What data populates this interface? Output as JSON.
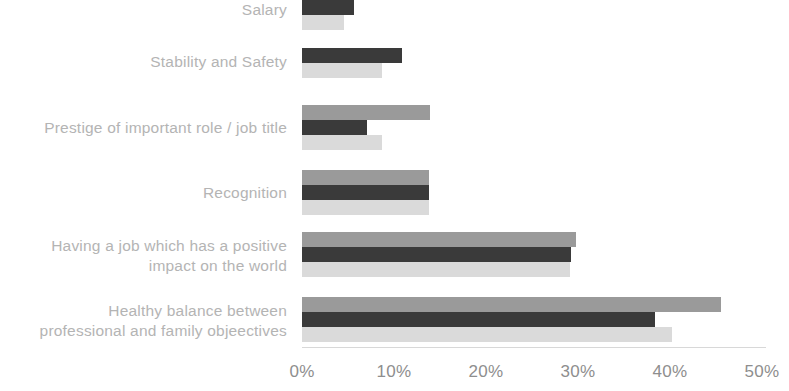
{
  "chart_data": {
    "type": "bar",
    "orientation": "horizontal",
    "title": "",
    "subtitle": "",
    "xlabel": "",
    "ylabel": "",
    "xlim": [
      0,
      50
    ],
    "xunit": "%",
    "grid": false,
    "legend": "none",
    "xticks": [
      {
        "label": "0%",
        "value": 0
      },
      {
        "label": "10%",
        "value": 10
      },
      {
        "label": "20%",
        "value": 20
      },
      {
        "label": "30%",
        "value": 30
      },
      {
        "label": "40%",
        "value": 40
      },
      {
        "label": "50%",
        "value": 50
      }
    ],
    "categories": [
      "Salary",
      "Stability and Safety",
      "Prestige of important role / job title",
      "Recognition",
      "Having a job which has a positive\nimpact on the world",
      "Healthy balance between\nprofessional and family objeectives"
    ],
    "series": [
      {
        "name": "series-a",
        "color": "#9a9a9a",
        "values": [
          null,
          null,
          13.9,
          13.8,
          29.8,
          45.5
        ]
      },
      {
        "name": "series-b",
        "color": "#3a3a3a",
        "values": [
          5.7,
          10.9,
          7.1,
          13.8,
          29.2,
          38.4
        ]
      },
      {
        "name": "series-c",
        "color": "#dadada",
        "values": [
          4.6,
          8.7,
          8.7,
          13.8,
          29.1,
          40.2
        ]
      }
    ]
  },
  "axis": {
    "tick_color": "#8e8e8e",
    "line_color": "#d8d8d8"
  },
  "labels": {
    "color": "#b4b4b4"
  }
}
